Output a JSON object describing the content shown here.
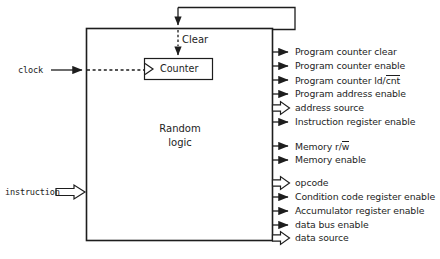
{
  "figure": {
    "block_label_line1": "Random",
    "block_label_line2": "logic",
    "clear_label": "Clear",
    "counter_label": "Counter",
    "caption": ""
  },
  "inputs": [
    {
      "label": "clock",
      "style": "dashed-line-arrow",
      "y": 70
    },
    {
      "label": "instruction",
      "style": "open-block-arrow",
      "y": 192
    }
  ],
  "outputs": [
    {
      "label": "Program counter clear",
      "arrow": "solid",
      "y": 52
    },
    {
      "label": "Program counter enable",
      "arrow": "solid",
      "y": 66
    },
    {
      "label": "Program counter ld/cnt",
      "arrow": "solid",
      "y": 80,
      "overbar_text": "cnt",
      "prefix_text": "Program counter ld/"
    },
    {
      "label": "Program address enable",
      "arrow": "solid",
      "y": 94
    },
    {
      "label": "address  source",
      "arrow": "open",
      "y": 108
    },
    {
      "label": "Instruction register enable",
      "arrow": "solid",
      "y": 122
    },
    {
      "label": "Memory r/w",
      "arrow": "solid",
      "y": 146,
      "overbar_text": "w",
      "prefix_text": "Memory r/"
    },
    {
      "label": "Memory enable",
      "arrow": "solid",
      "y": 160
    },
    {
      "label": "opcode",
      "arrow": "open",
      "y": 183
    },
    {
      "label": "Condition code register enable",
      "arrow": "solid",
      "y": 197
    },
    {
      "label": "Accumulator register enable",
      "arrow": "solid",
      "y": 211
    },
    {
      "label": "data  bus  enable",
      "arrow": "solid",
      "y": 225
    },
    {
      "label": "data  source",
      "arrow": "open",
      "y": 238
    }
  ],
  "colors": {
    "stroke": "#1d1d1d",
    "background": "#ffffff",
    "caption": "#9b9b9b"
  }
}
